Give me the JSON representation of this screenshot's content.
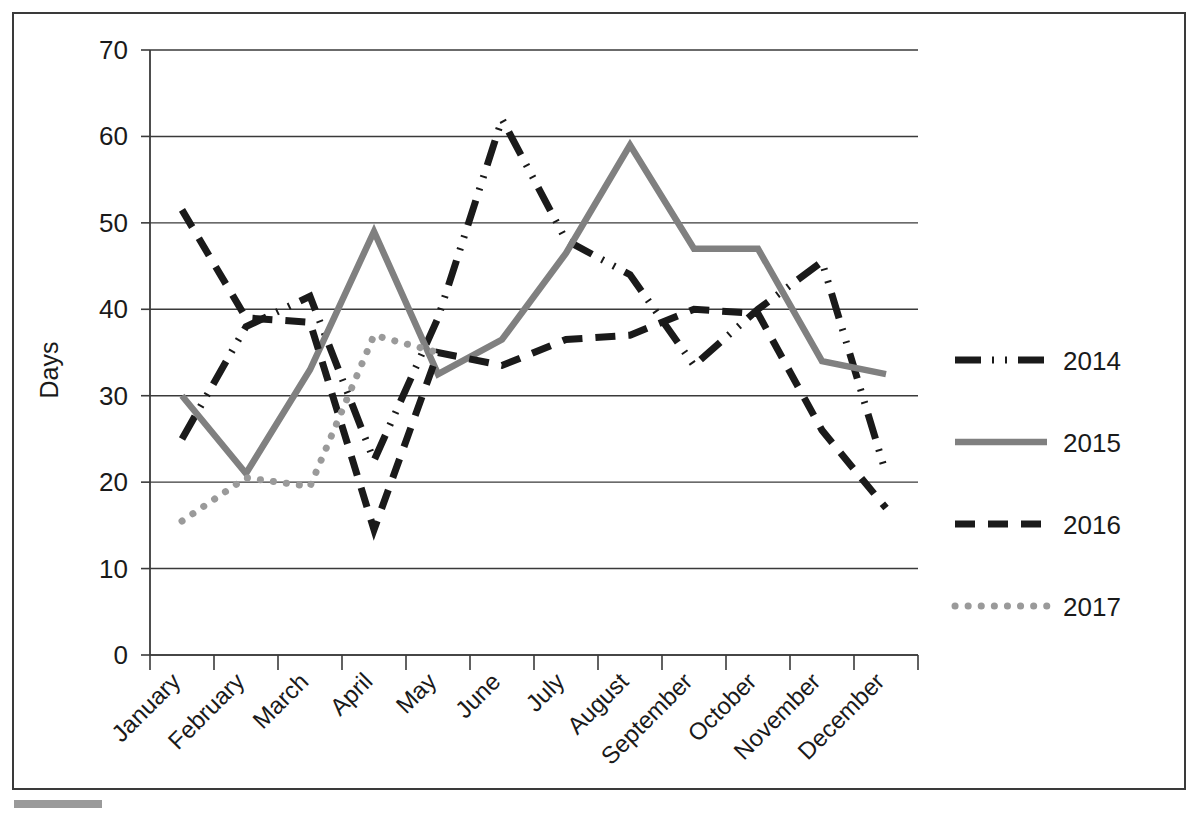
{
  "chart_data": {
    "type": "line",
    "title": "",
    "xlabel": "",
    "ylabel": "Days",
    "ylim": [
      0,
      70
    ],
    "ytick_step": 10,
    "yticks": [
      "0",
      "10",
      "20",
      "30",
      "40",
      "50",
      "60",
      "70"
    ],
    "grid": "horizontal",
    "legend_position": "right",
    "categories": [
      "January",
      "February",
      "March",
      "April",
      "May",
      "June",
      "July",
      "August",
      "September",
      "October",
      "November",
      "December"
    ],
    "series": [
      {
        "name": "2014",
        "style": "dash-dot-dot",
        "color": "#1a1a1a",
        "values": [
          25,
          38,
          41.5,
          22.5,
          39,
          62,
          48,
          44,
          33.5,
          40,
          45.5,
          21
        ]
      },
      {
        "name": "2015",
        "style": "solid",
        "color": "#808080",
        "values": [
          30,
          21,
          33,
          49,
          32.5,
          36.5,
          46.5,
          59,
          47,
          47,
          34,
          32.5
        ]
      },
      {
        "name": "2016",
        "style": "dashed",
        "color": "#1a1a1a",
        "values": [
          51.5,
          39,
          38.5,
          14.5,
          35,
          33.5,
          36.5,
          37,
          40,
          39.5,
          26,
          17
        ]
      },
      {
        "name": "2017",
        "style": "dotted",
        "color": "#9a9a9a",
        "values": [
          15.5,
          20.5,
          19.5,
          37,
          35,
          null,
          null,
          null,
          null,
          null,
          null,
          null
        ]
      }
    ]
  },
  "legend": {
    "entries": [
      {
        "label": "2014"
      },
      {
        "label": "2015"
      },
      {
        "label": "2016"
      },
      {
        "label": "2017"
      }
    ]
  }
}
